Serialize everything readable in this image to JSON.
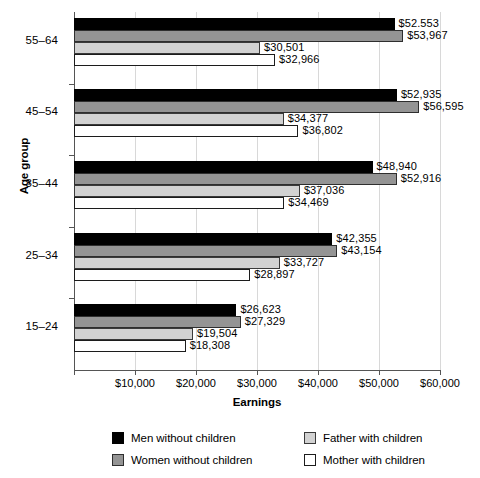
{
  "chart_data": {
    "type": "bar",
    "orientation": "horizontal",
    "title": "",
    "xlabel": "Earnings",
    "ylabel": "Age group",
    "xlim": [
      0,
      60000
    ],
    "xticks": [
      0,
      10000,
      20000,
      30000,
      40000,
      50000,
      60000
    ],
    "xtick_labels": [
      "",
      "$10,000",
      "$20,000",
      "$30,000",
      "$40,000",
      "$50,000",
      "$60,000"
    ],
    "grid": true,
    "legend_position": "bottom",
    "categories": [
      "55–64",
      "45–54",
      "35–44",
      "25–34",
      "15–24"
    ],
    "series": [
      {
        "name": "Men without children",
        "color": "#000000",
        "values": [
          52553,
          52935,
          48940,
          42355,
          26623
        ],
        "labels": [
          "$52.553",
          "$52,935",
          "$48,940",
          "$42,355",
          "$26,623"
        ]
      },
      {
        "name": "Women without children",
        "color": "#949494",
        "values": [
          53967,
          56595,
          52916,
          43154,
          27329
        ],
        "labels": [
          "$53,967",
          "$56,595",
          "$52,916",
          "$43,154",
          "$27,329"
        ]
      },
      {
        "name": "Father with children",
        "color": "#d2d2d2",
        "values": [
          30501,
          34377,
          37036,
          33727,
          19504
        ],
        "labels": [
          "$30,501",
          "$34,377",
          "$37,036",
          "$33,727",
          "$19,504"
        ]
      },
      {
        "name": "Mother with children",
        "color": "#ffffff",
        "values": [
          32966,
          36802,
          34469,
          28897,
          18308
        ],
        "labels": [
          "$32,966",
          "$36,802",
          "$34,469",
          "$28,897",
          "$18,308"
        ]
      }
    ]
  },
  "axes": {
    "y_title": "Age group",
    "x_title": "Earnings",
    "x_tick_labels": [
      "$10,000",
      "$20,000",
      "$30,000",
      "$40,000",
      "$50,000",
      "$60,000"
    ],
    "y_tick_labels": [
      "55–64",
      "45–54",
      "35–44",
      "25–34",
      "15–24"
    ]
  },
  "legend": {
    "items": [
      {
        "label": "Men without children",
        "swatch": "s0"
      },
      {
        "label": "Father with children",
        "swatch": "s2"
      },
      {
        "label": "Women without children",
        "swatch": "s1"
      },
      {
        "label": "Mother with children",
        "swatch": "s3"
      }
    ]
  }
}
